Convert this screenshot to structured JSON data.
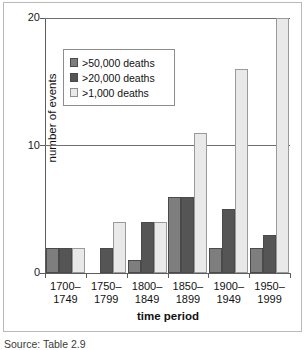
{
  "chart_data": {
    "type": "bar",
    "title": "",
    "xlabel": "time period",
    "ylabel": "number of events",
    "categories": [
      "1700–1749",
      "1750–1799",
      "1800–1849",
      "1850–1899",
      "1900–1949",
      "1950–1999"
    ],
    "category_lines": [
      [
        "1700–",
        "1749"
      ],
      [
        "1750–",
        "1799"
      ],
      [
        "1800–",
        "1849"
      ],
      [
        "1850–",
        "1899"
      ],
      [
        "1900–",
        "1949"
      ],
      [
        "1950–",
        "1999"
      ]
    ],
    "series": [
      {
        "name": ">50,000 deaths",
        "color": "#7e7e7e",
        "values": [
          2,
          0,
          1,
          6,
          2,
          2
        ]
      },
      {
        "name": ">20,000 deaths",
        "color": "#555555",
        "values": [
          2,
          2,
          4,
          6,
          5,
          3
        ]
      },
      {
        "name": ">1,000 deaths",
        "color": "#e9e9e9",
        "values": [
          2,
          4,
          4,
          11,
          16,
          20
        ]
      }
    ],
    "ylim": [
      0,
      20
    ],
    "yticks": [
      0,
      10,
      20
    ],
    "ytick_labels": [
      "0",
      "10",
      "20"
    ],
    "grid": true,
    "gridlines_at": [
      10,
      20
    ],
    "legend_position": "inside-upper-left"
  },
  "caption": {
    "text": "Source: Table 2.9"
  }
}
